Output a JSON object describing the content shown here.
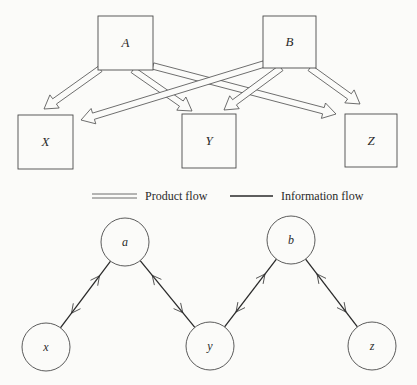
{
  "top_diagram": {
    "description": "Product flow network",
    "nodes": [
      {
        "id": "A",
        "label": "A",
        "x": 98,
        "y": 16,
        "w": 55,
        "h": 54
      },
      {
        "id": "B",
        "label": "B",
        "x": 263,
        "y": 16,
        "w": 53,
        "h": 52
      },
      {
        "id": "X",
        "label": "X",
        "x": 18,
        "y": 115,
        "w": 55,
        "h": 54
      },
      {
        "id": "Y",
        "label": "Y",
        "x": 182,
        "y": 114,
        "w": 54,
        "h": 54
      },
      {
        "id": "Z",
        "label": "Z",
        "x": 345,
        "y": 114,
        "w": 52,
        "h": 53
      }
    ],
    "edges": [
      {
        "from": "A",
        "to": "X",
        "type": "product",
        "x1": 100,
        "y1": 69,
        "x2": 44,
        "y2": 109
      },
      {
        "from": "A",
        "to": "Y",
        "type": "product",
        "x1": 133,
        "y1": 70,
        "x2": 192,
        "y2": 111
      },
      {
        "from": "A",
        "to": "Z",
        "type": "product",
        "x1": 153,
        "y1": 66,
        "x2": 336,
        "y2": 114
      },
      {
        "from": "B",
        "to": "X",
        "type": "product",
        "x1": 264,
        "y1": 64,
        "x2": 81,
        "y2": 120
      },
      {
        "from": "B",
        "to": "Y",
        "type": "product",
        "x1": 281,
        "y1": 68,
        "x2": 224,
        "y2": 110
      },
      {
        "from": "B",
        "to": "Z",
        "type": "product",
        "x1": 310,
        "y1": 68,
        "x2": 360,
        "y2": 104
      }
    ]
  },
  "legend": {
    "product_flow_label": "Product flow",
    "information_flow_label": "Information flow"
  },
  "bottom_diagram": {
    "description": "Information flow network",
    "nodes": [
      {
        "id": "a",
        "label": "a",
        "cx": 125,
        "cy": 242,
        "r": 24
      },
      {
        "id": "b",
        "label": "b",
        "cx": 291,
        "cy": 240,
        "r": 24
      },
      {
        "id": "x",
        "label": "x",
        "cx": 46,
        "cy": 347,
        "r": 24
      },
      {
        "id": "y",
        "label": "y",
        "cx": 210,
        "cy": 346,
        "r": 24
      },
      {
        "id": "z",
        "label": "z",
        "cx": 372,
        "cy": 346,
        "r": 24
      }
    ],
    "edges": [
      {
        "from": "x",
        "to": "a",
        "type": "information",
        "bidirectional": true
      },
      {
        "from": "a",
        "to": "y",
        "type": "information",
        "bidirectional": true
      },
      {
        "from": "y",
        "to": "b",
        "type": "information",
        "bidirectional": true
      },
      {
        "from": "b",
        "to": "z",
        "type": "information",
        "bidirectional": true
      }
    ]
  },
  "colors": {
    "background": "#fbfbf9",
    "stroke": "#4a4a4a",
    "text": "#2a2a2a"
  }
}
